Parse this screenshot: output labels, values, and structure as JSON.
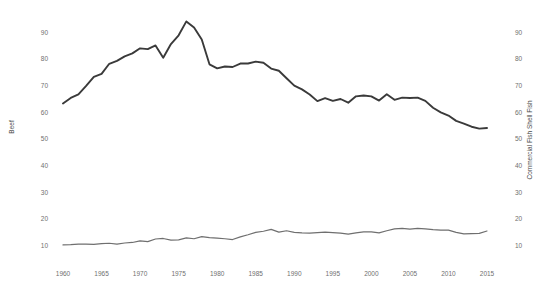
{
  "chart_data": {
    "type": "line",
    "title": "",
    "xlabel": "",
    "ylabel": "Beef",
    "y2label": "Commercial Fish Shell Fish",
    "grid": false,
    "legend_position": "none",
    "xlim": [
      1960,
      2015
    ],
    "ylim": [
      5,
      95
    ],
    "y2lim": [
      5,
      95
    ],
    "yticks": [
      10,
      20,
      30,
      40,
      50,
      60,
      70,
      80,
      90
    ],
    "y2ticks": [
      10,
      20,
      30,
      40,
      50,
      60,
      70,
      80,
      90
    ],
    "ytick_labels": [
      "10",
      "20",
      "30",
      "40",
      "50",
      "60",
      "70",
      "80",
      "90"
    ],
    "y2tick_labels": [
      "10",
      "20",
      "30",
      "40",
      "50",
      "60",
      "70",
      "80",
      "90"
    ],
    "xticks": [
      1960,
      1965,
      1970,
      1975,
      1980,
      1985,
      1990,
      1995,
      2000,
      2005,
      2010,
      2015
    ],
    "xtick_labels": [
      "1960",
      "1965",
      "1970",
      "1975",
      "1980",
      "1985",
      "1990",
      "1995",
      "2000",
      "2005",
      "2010",
      "2015"
    ],
    "x": [
      1960,
      1961,
      1962,
      1963,
      1964,
      1965,
      1966,
      1967,
      1968,
      1969,
      1970,
      1971,
      1972,
      1973,
      1974,
      1975,
      1976,
      1977,
      1978,
      1979,
      1980,
      1981,
      1982,
      1983,
      1984,
      1985,
      1986,
      1987,
      1988,
      1989,
      1990,
      1991,
      1992,
      1993,
      1994,
      1995,
      1996,
      1997,
      1998,
      1999,
      2000,
      2001,
      2002,
      2003,
      2004,
      2005,
      2006,
      2007,
      2008,
      2009,
      2010,
      2011,
      2012,
      2013,
      2014,
      2015
    ],
    "series": [
      {
        "name": "Beef",
        "axis": "left",
        "color": "#3a3a3a",
        "width": 1.9,
        "values": [
          63.3,
          65.4,
          66.7,
          69.9,
          73.3,
          74.4,
          78.2,
          79.3,
          81.0,
          82.1,
          84.0,
          83.7,
          85.1,
          80.5,
          85.6,
          88.9,
          94.1,
          91.8,
          87.3,
          78.0,
          76.5,
          77.2,
          77.0,
          78.3,
          78.3,
          79.0,
          78.6,
          76.4,
          75.6,
          72.8,
          70.0,
          68.6,
          66.7,
          64.2,
          65.3,
          64.3,
          65.0,
          63.6,
          66.0,
          66.3,
          66.0,
          64.4,
          66.8,
          64.7,
          65.5,
          65.4,
          65.5,
          64.3,
          61.7,
          60.0,
          58.8,
          56.8,
          55.8,
          54.6,
          53.9,
          54.1
        ]
      },
      {
        "name": "Commercial Fish Shell Fish",
        "axis": "right",
        "color": "#6f6f6f",
        "width": 1.2,
        "values": [
          10.3,
          10.4,
          10.6,
          10.6,
          10.5,
          10.8,
          10.9,
          10.6,
          11.0,
          11.2,
          11.8,
          11.5,
          12.5,
          12.7,
          12.1,
          12.2,
          12.9,
          12.6,
          13.4,
          13.0,
          12.8,
          12.6,
          12.3,
          13.3,
          14.1,
          15.0,
          15.4,
          16.1,
          15.1,
          15.6,
          15.0,
          14.8,
          14.7,
          14.9,
          15.1,
          14.9,
          14.7,
          14.3,
          14.8,
          15.2,
          15.2,
          14.8,
          15.6,
          16.3,
          16.5,
          16.2,
          16.5,
          16.3,
          16.0,
          15.8,
          15.8,
          15.0,
          14.4,
          14.5,
          14.6,
          15.5
        ]
      }
    ]
  },
  "axes": {
    "left_title": "Beef",
    "right_title": "Commercial Fish Shell Fish"
  }
}
